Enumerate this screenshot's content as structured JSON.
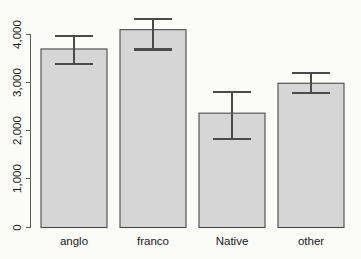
{
  "chart_data": {
    "type": "bar",
    "title": "",
    "subtitle": "",
    "xlabel": "",
    "ylabel": "",
    "categories": [
      "anglo",
      "franco",
      "Native",
      "other"
    ],
    "values": [
      3700,
      4100,
      2370,
      2990
    ],
    "error_upper": [
      3960,
      4330,
      2810,
      3210
    ],
    "error_lower": [
      3380,
      3690,
      1830,
      2790
    ],
    "ylim": [
      0,
      4400
    ],
    "y_ticks": [
      0,
      1000,
      2000,
      3000,
      4000
    ],
    "y_tick_labels": [
      "0",
      "1,000",
      "2,000",
      "3,000",
      "4,000"
    ],
    "grid": false,
    "legend": null,
    "legend_position": "none",
    "series": [
      {
        "name": "mean",
        "values": [
          3700,
          4100,
          2370,
          2990
        ]
      }
    ],
    "bar_fill_color": "#d6d6d6",
    "bar_border_color": "#4a4a4a",
    "error_bar_color": "#4a4a4a",
    "background_color": "#fbfbf8",
    "axis_color": "#5a5a5a"
  },
  "axes": {
    "y_tick_labels": [
      "0",
      "1,000",
      "2,000",
      "3,000",
      "4,000"
    ],
    "x_tick_labels": [
      "anglo",
      "franco",
      "Native",
      "other"
    ]
  }
}
